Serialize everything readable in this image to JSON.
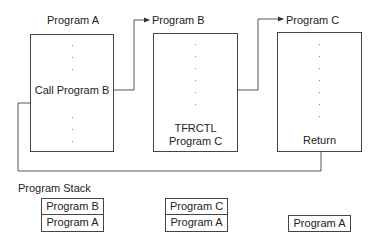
{
  "programs": [
    {
      "title": "Program A",
      "statement": "Call Program B"
    },
    {
      "title": "Program B",
      "statement_line1": "TFRCTL",
      "statement_line2": "Program C"
    },
    {
      "title": "Program C",
      "statement": "Return"
    }
  ],
  "stack": {
    "label": "Program Stack",
    "states": [
      [
        "Program B",
        "Program A"
      ],
      [
        "Program C",
        "Program A"
      ],
      [
        "Program A"
      ]
    ]
  },
  "colors": {
    "line": "#444444",
    "text": "#222222",
    "background": "#ffffff"
  }
}
